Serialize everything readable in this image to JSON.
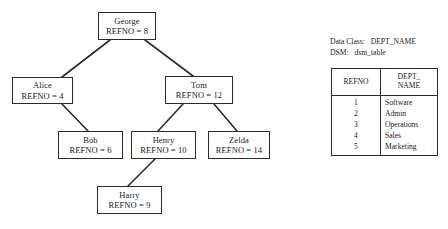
{
  "diagram": {
    "type": "binary-search-tree",
    "nodes": [
      {
        "id": "george",
        "name": "George",
        "refno_label": "REFNO = 8",
        "refno": 8,
        "x": 98,
        "y": 12,
        "w": 58,
        "h": 28
      },
      {
        "id": "alice",
        "name": "Alice",
        "refno_label": "REFNO = 4",
        "refno": 4,
        "x": 12,
        "y": 77,
        "w": 61,
        "h": 27
      },
      {
        "id": "tom",
        "name": "Tom",
        "refno_label": "REFNO = 12",
        "refno": 12,
        "x": 165,
        "y": 76,
        "w": 68,
        "h": 28
      },
      {
        "id": "bob",
        "name": "Bob",
        "refno_label": "REFNO = 6",
        "refno": 6,
        "x": 58,
        "y": 131,
        "w": 65,
        "h": 28
      },
      {
        "id": "henry",
        "name": "Henry",
        "refno_label": "REFNO = 10",
        "refno": 10,
        "x": 131,
        "y": 131,
        "w": 65,
        "h": 28
      },
      {
        "id": "zelda",
        "name": "Zelda",
        "refno_label": "REFNO = 14",
        "refno": 14,
        "x": 208,
        "y": 131,
        "w": 62,
        "h": 28
      },
      {
        "id": "harry",
        "name": "Harry",
        "refno_label": "REFNO = 9",
        "refno": 9,
        "x": 97,
        "y": 186,
        "w": 65,
        "h": 28
      }
    ],
    "edges": [
      {
        "from": "george",
        "to": "alice",
        "side": "left",
        "x1": 110,
        "y1": 40,
        "x2": 62,
        "y2": 77
      },
      {
        "from": "george",
        "to": "tom",
        "side": "right",
        "x1": 145,
        "y1": 40,
        "x2": 193,
        "y2": 76
      },
      {
        "from": "alice",
        "to": "bob",
        "side": "right",
        "x1": 62,
        "y1": 104,
        "x2": 88,
        "y2": 131
      },
      {
        "from": "tom",
        "to": "henry",
        "side": "left",
        "x1": 183,
        "y1": 104,
        "x2": 158,
        "y2": 131
      },
      {
        "from": "tom",
        "to": "zelda",
        "side": "right",
        "x1": 214,
        "y1": 104,
        "x2": 237,
        "y2": 131
      },
      {
        "from": "henry",
        "to": "harry",
        "side": "left",
        "x1": 155,
        "y1": 159,
        "x2": 128,
        "y2": 186
      }
    ],
    "stroke_color": "#2b2b2b",
    "fill_color": "#ffffff"
  },
  "legend": {
    "data_class": {
      "key": "Data Class:",
      "value": "DEPT_NAME"
    },
    "dsm": {
      "key": "DSM:",
      "value": "dsm_table"
    }
  },
  "table": {
    "headers": {
      "refno": "REFNO",
      "dept_line1": "DEPT_",
      "dept_line2": "NAME"
    },
    "rows": [
      {
        "refno": "1",
        "dept_name": "Software"
      },
      {
        "refno": "2",
        "dept_name": "Admin"
      },
      {
        "refno": "3",
        "dept_name": "Operations"
      },
      {
        "refno": "4",
        "dept_name": "Sales"
      },
      {
        "refno": "5",
        "dept_name": "Marketing"
      }
    ]
  }
}
